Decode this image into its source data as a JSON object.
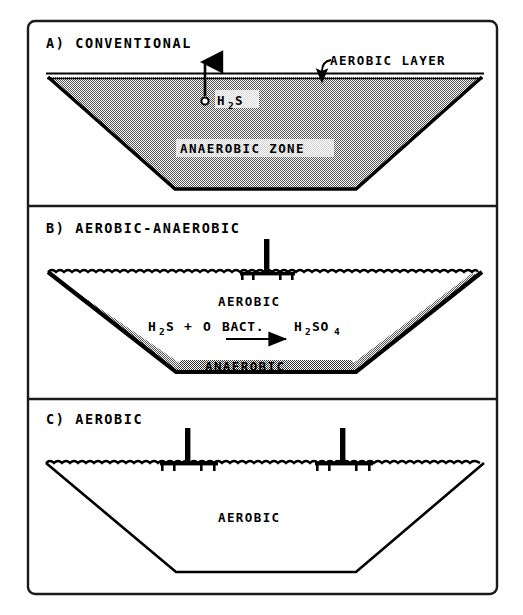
{
  "figure": {
    "frame": {
      "style": "rounded-rectangle-border",
      "color": "#1a1a1a"
    },
    "colors": {
      "ink": "#000000",
      "stipple_gray": "#808080",
      "background": "#ffffff"
    }
  },
  "panels": [
    {
      "id": "a",
      "label": "A) CONVENTIONAL",
      "annotations": [
        {
          "name": "aerobic-layer-callout",
          "text": "AEROBIC LAYER"
        },
        {
          "name": "h2s-label",
          "text": "H",
          "sub": "2",
          "text2": "S",
          "full": "H2S"
        },
        {
          "name": "anaerobic-zone-label",
          "text": "ANAEROBIC ZONE"
        }
      ],
      "features": {
        "fill": "stipple",
        "surface": "straight-double-line",
        "aerators": 0,
        "gas_bubble": true,
        "gas_arrow_direction": "up"
      }
    },
    {
      "id": "b",
      "label": "B) AEROBIC-ANAEROBIC",
      "annotations": [
        {
          "name": "aerobic-zone-label",
          "text": "AEROBIC"
        },
        {
          "name": "reaction-equation",
          "reactant1": "H",
          "reactant1_sub": "2",
          "reactant1_end": "S",
          "plus": "+",
          "oxygen": "O",
          "catalyst": "BACT.",
          "product": "H",
          "product_sub": "2",
          "product_mid": "SO",
          "product_sub2": "4",
          "full": "H2S + O BACT. → H2SO4"
        },
        {
          "name": "anaerobic-layer-label",
          "text": "ANAEROBIC"
        }
      ],
      "features": {
        "fill": "clear-with-stipple-lining",
        "surface": "wavy-line",
        "aerators": 1,
        "gas_bubble": false
      }
    },
    {
      "id": "c",
      "label": "C) AEROBIC",
      "annotations": [
        {
          "name": "aerobic-zone-label",
          "text": "AEROBIC"
        }
      ],
      "features": {
        "fill": "none",
        "surface": "wavy-line",
        "aerators": 2,
        "gas_bubble": false
      }
    }
  ]
}
